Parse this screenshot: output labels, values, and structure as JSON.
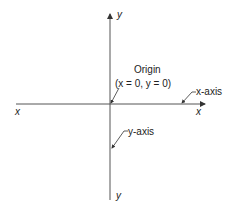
{
  "diagram": {
    "axis_labels": {
      "y_top": "y",
      "y_bottom": "y",
      "x_left": "x",
      "x_right": "x"
    },
    "origin": {
      "label": "Origin",
      "coords": "(x = 0, y = 0)"
    },
    "annotations": {
      "x_axis": "x-axis",
      "y_axis": "y-axis"
    },
    "colors": {
      "line": "#333333",
      "text": "#222222",
      "background": "#ffffff"
    }
  }
}
